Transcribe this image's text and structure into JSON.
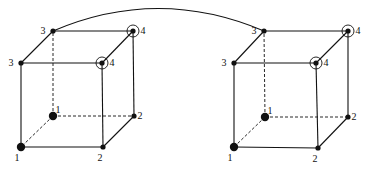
{
  "diagram": {
    "cubes": [
      {
        "id": "left",
        "vertices": {
          "front_bottom_left": {
            "label": "1",
            "marker": "large-dot"
          },
          "back_bottom_left": {
            "label": "1",
            "marker": "large-dot"
          },
          "front_bottom_right": {
            "label": "2",
            "marker": "dot"
          },
          "back_bottom_right": {
            "label": "2",
            "marker": "dot"
          },
          "front_top_left": {
            "label": "3",
            "marker": "dot"
          },
          "back_top_left": {
            "label": "3",
            "marker": "dot"
          },
          "front_top_right": {
            "label": "4",
            "marker": "circled-dot"
          },
          "back_top_right": {
            "label": "4",
            "marker": "circled-dot"
          }
        }
      },
      {
        "id": "right",
        "vertices": {
          "front_bottom_left": {
            "label": "1",
            "marker": "large-dot"
          },
          "back_bottom_left": {
            "label": "1",
            "marker": "large-dot"
          },
          "front_bottom_right": {
            "label": "2",
            "marker": "dot"
          },
          "back_bottom_right": {
            "label": "2",
            "marker": "dot"
          },
          "front_top_left": {
            "label": "3",
            "marker": "dot"
          },
          "back_top_left": {
            "label": "3",
            "marker": "dot"
          },
          "front_top_right": {
            "label": "4",
            "marker": "circled-dot"
          },
          "back_top_right": {
            "label": "4",
            "marker": "circled-dot"
          }
        }
      }
    ],
    "connection": {
      "from": "left.back_top_left",
      "to": "right.back_top_left",
      "style": "arc"
    }
  }
}
